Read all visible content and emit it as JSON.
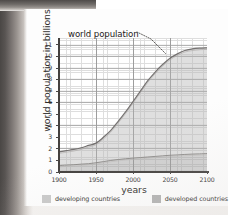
{
  "figure": {
    "annotation": "world population",
    "xlabel": "years",
    "ylabel": "world population in billions"
  },
  "legend": {
    "items": [
      {
        "label": "developing countries",
        "color": "#c9c9c9"
      },
      {
        "label": "developed countries",
        "color": "#b3b3b3"
      }
    ]
  },
  "axes": {
    "y_ticks": [
      "0",
      "1",
      "2",
      "3",
      "4",
      "5",
      "6",
      "7",
      "8",
      "9",
      "10",
      "11"
    ],
    "x_ticks": [
      "1900",
      "1950",
      "2000",
      "2050",
      "2100"
    ]
  },
  "chart_data": {
    "type": "area",
    "title": "world population",
    "xlabel": "years",
    "ylabel": "world population in billions",
    "xlim": [
      1900,
      2100
    ],
    "ylim": [
      0,
      11.6
    ],
    "grid": true,
    "stacked": true,
    "legend_position": "bottom",
    "annotations": [
      {
        "text": "world population",
        "points_to": "top boundary of stacked total curve",
        "at_x": 2010,
        "at_y": 9.0
      }
    ],
    "x": [
      1900,
      1910,
      1920,
      1930,
      1940,
      1950,
      1960,
      1970,
      1980,
      1990,
      2000,
      2010,
      2020,
      2030,
      2040,
      2050,
      2060,
      2070,
      2080,
      2090,
      2100
    ],
    "series": [
      {
        "name": "developed countries",
        "color": "#b3b3b3",
        "values": [
          0.55,
          0.6,
          0.63,
          0.68,
          0.72,
          0.8,
          0.9,
          1.0,
          1.08,
          1.15,
          1.2,
          1.25,
          1.3,
          1.35,
          1.4,
          1.45,
          1.48,
          1.52,
          1.55,
          1.57,
          1.6
        ]
      },
      {
        "name": "developing countries",
        "color": "#c9c9c9",
        "values": [
          1.2,
          1.25,
          1.32,
          1.42,
          1.58,
          1.7,
          2.1,
          2.6,
          3.3,
          4.05,
          4.9,
          5.75,
          6.6,
          7.3,
          7.9,
          8.4,
          8.75,
          9.0,
          9.1,
          9.15,
          9.15
        ]
      }
    ],
    "total": {
      "name": "world population",
      "values": [
        1.75,
        1.85,
        1.95,
        2.1,
        2.3,
        2.5,
        3.0,
        3.6,
        4.38,
        5.2,
        6.1,
        7.0,
        7.9,
        8.65,
        9.3,
        9.85,
        10.23,
        10.52,
        10.65,
        10.72,
        10.75
      ]
    }
  }
}
